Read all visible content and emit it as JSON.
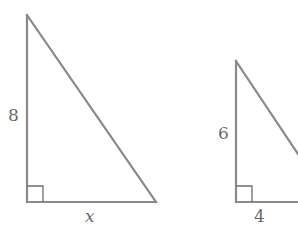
{
  "figure": {
    "triangles": [
      {
        "id": "triangle-left",
        "vertical_leg_label": "8",
        "horizontal_leg_label": "x",
        "right_angle": "bottom-left",
        "vertical_leg_value": 8,
        "horizontal_leg_value": "x"
      },
      {
        "id": "triangle-right",
        "vertical_leg_label": "6",
        "horizontal_leg_label": "4",
        "right_angle": "bottom-left",
        "vertical_leg_value": 6,
        "horizontal_leg_value": 4
      }
    ],
    "colors": {
      "stroke": "#8a8a8a",
      "label": "#6a6a6a",
      "background": "#ffffff"
    }
  }
}
